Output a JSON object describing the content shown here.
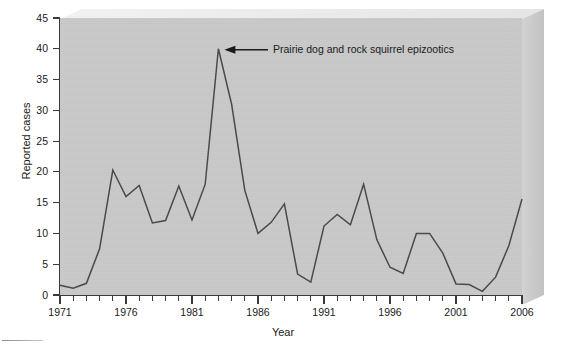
{
  "chart_data": {
    "type": "line",
    "title": "",
    "xlabel": "Year",
    "ylabel": "Reported cases",
    "xlim": [
      1971,
      2006
    ],
    "ylim": [
      0,
      45
    ],
    "ytick_step": 5,
    "xtick_step": 5,
    "grid": false,
    "legend": "none",
    "x": [
      1971,
      1972,
      1973,
      1974,
      1975,
      1976,
      1977,
      1978,
      1979,
      1980,
      1981,
      1982,
      1983,
      1984,
      1985,
      1986,
      1987,
      1988,
      1989,
      1990,
      1991,
      1992,
      1993,
      1994,
      1995,
      1996,
      1997,
      1998,
      1999,
      2000,
      2001,
      2002,
      2003,
      2004,
      2005,
      2006
    ],
    "series": [
      {
        "name": "Reported cases",
        "color": "#4a4a4a",
        "values": [
          1.6,
          1.1,
          1.9,
          7.5,
          20.3,
          16.0,
          17.8,
          11.7,
          12.1,
          17.7,
          12.2,
          18.0,
          40.0,
          31.0,
          17.0,
          10.0,
          11.8,
          14.8,
          3.4,
          2.1,
          11.2,
          13.1,
          11.4,
          18.0,
          9.0,
          4.5,
          3.5,
          10.0,
          10.0,
          6.8,
          1.8,
          1.7,
          0.6,
          2.9,
          8.0,
          15.6
        ]
      }
    ],
    "ytick_labels": [
      "0",
      "5",
      "10",
      "15",
      "20",
      "25",
      "30",
      "35",
      "40",
      "45"
    ],
    "xtick_labels": [
      "1971",
      "1976",
      "1981",
      "1986",
      "1991",
      "1996",
      "2001",
      "2006"
    ],
    "annotations": [
      {
        "text": "Prairie dog and rock squirrel epizootics",
        "points_to_x": 1983,
        "points_to_y": 40
      }
    ]
  },
  "axes": {
    "y_title": "Reported cases",
    "x_title": "Year"
  },
  "annotation": {
    "text": "Prairie dog and rock squirrel epizootics"
  },
  "colors": {
    "plot_background": "#c8c8c8",
    "box_top": "#e9e9e9",
    "box_side": "#cacaca",
    "series_line": "#4a4a4a",
    "axis": "#3a3a3a",
    "text": "#1a1a1a",
    "page_background": "#ffffff"
  }
}
